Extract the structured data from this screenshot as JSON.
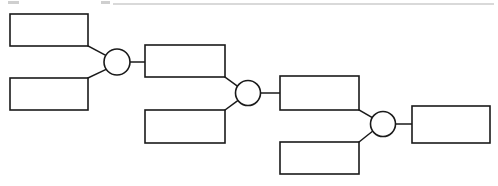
{
  "page": {
    "background_color": "#ffffff",
    "line_color": "#1a1a1a",
    "width": 498,
    "height": 186
  },
  "diagram": {
    "type": "cascading-block-diagram",
    "orientation": "left-to-right descending stair",
    "boxes": [
      {
        "id": "box-1",
        "label": "",
        "x": 10,
        "y": 14,
        "w": 78,
        "h": 32
      },
      {
        "id": "box-2",
        "label": "",
        "x": 10,
        "y": 78,
        "w": 78,
        "h": 32
      },
      {
        "id": "box-3",
        "label": "",
        "x": 145,
        "y": 45,
        "w": 80,
        "h": 32
      },
      {
        "id": "box-4",
        "label": "",
        "x": 145,
        "y": 110,
        "w": 80,
        "h": 33
      },
      {
        "id": "box-5",
        "label": "",
        "x": 280,
        "y": 76,
        "w": 79,
        "h": 34
      },
      {
        "id": "box-6",
        "label": "",
        "x": 280,
        "y": 142,
        "w": 79,
        "h": 32
      },
      {
        "id": "box-7",
        "label": "",
        "x": 412,
        "y": 106,
        "w": 78,
        "h": 37
      }
    ],
    "gates": [
      {
        "id": "gate-1",
        "label": "",
        "cx": 117,
        "cy": 62,
        "r": 13
      },
      {
        "id": "gate-2",
        "label": "",
        "cx": 248,
        "cy": 93,
        "r": 12.5
      },
      {
        "id": "gate-3",
        "label": "",
        "cx": 383,
        "cy": 124,
        "r": 12.5
      }
    ],
    "connectors": [
      {
        "id": "conn-box1-gate1",
        "from": "box-1",
        "to": "gate-1",
        "path": "M 88 46 L 107 56"
      },
      {
        "id": "conn-box2-gate1",
        "from": "box-2",
        "to": "gate-1",
        "path": "M 88 78 L 107 69"
      },
      {
        "id": "conn-gate1-box3",
        "from": "gate-1",
        "to": "box-3",
        "path": "M 130 62 L 145 62"
      },
      {
        "id": "conn-box3-gate2",
        "from": "box-3",
        "to": "gate-2",
        "path": "M 225 77 L 238 87"
      },
      {
        "id": "conn-box4-gate2",
        "from": "box-4",
        "to": "gate-2",
        "path": "M 225 110 L 238 100"
      },
      {
        "id": "conn-gate2-box5",
        "from": "gate-2",
        "to": "box-5",
        "path": "M 261 93 L 280 93"
      },
      {
        "id": "conn-box5-gate3",
        "from": "box-5",
        "to": "gate-3",
        "path": "M 359 110 L 373 118"
      },
      {
        "id": "conn-box6-gate3",
        "from": "box-6",
        "to": "gate-3",
        "path": "M 359 142 L 373 131"
      },
      {
        "id": "conn-gate3-box7",
        "from": "gate-3",
        "to": "box-7",
        "path": "M 396 124 L 412 124"
      }
    ],
    "artifacts": {
      "top_rule": {
        "x1": 113,
        "y1": 4,
        "x2": 494,
        "y2": 4
      },
      "specks": [
        {
          "x": 8,
          "y": 1,
          "w": 11,
          "h": 3
        },
        {
          "x": 101,
          "y": 1,
          "w": 9,
          "h": 3
        }
      ]
    }
  }
}
